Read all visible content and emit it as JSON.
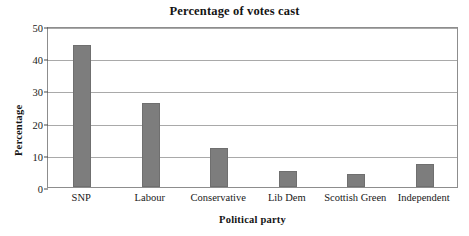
{
  "chart_data": {
    "type": "bar",
    "title": "Percentage of votes cast",
    "xlabel": "Political party",
    "ylabel": "Percentage",
    "categories": [
      "SNP",
      "Labour",
      "Conservative",
      "Lib Dem",
      "Scottish Green",
      "Independent"
    ],
    "values": [
      44,
      26,
      12,
      5,
      4,
      7
    ],
    "ylim": [
      0,
      50
    ],
    "yticks": [
      0,
      10,
      20,
      30,
      40,
      50
    ],
    "ytick_labels": [
      "0",
      "10",
      "20",
      "30",
      "40",
      "50"
    ],
    "grid": "horizontal",
    "legend": "none",
    "bar_color": "#7d7d7d",
    "gridline_color": "#a9a9a9",
    "frame_color": "#8d8d8d",
    "background_color": "#ffffff",
    "text_color": "#141414"
  }
}
